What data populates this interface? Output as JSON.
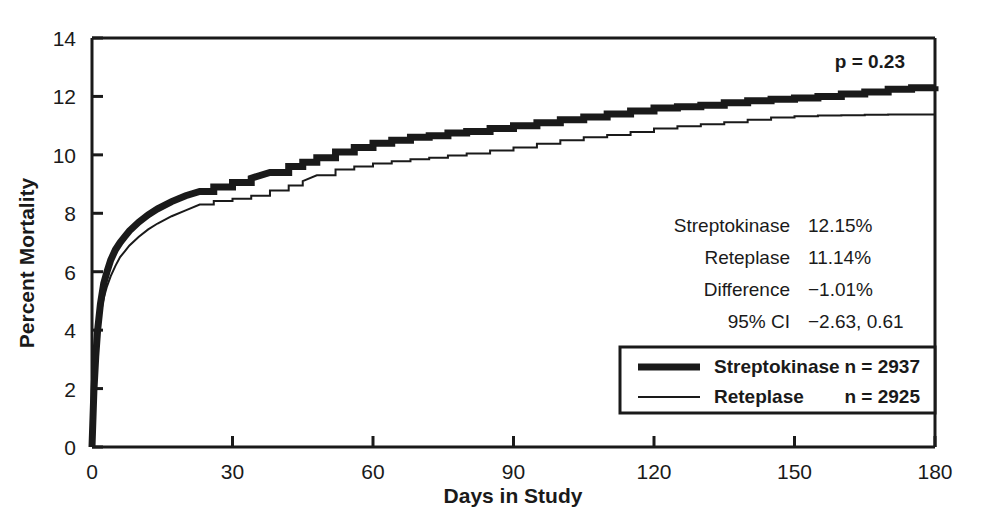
{
  "chart_data": {
    "type": "line",
    "title": "",
    "xlabel": "Days in Study",
    "ylabel": "Percent Mortality",
    "xlim": [
      0,
      180
    ],
    "ylim": [
      0,
      14
    ],
    "xticks": [
      0,
      30,
      60,
      90,
      120,
      150,
      180
    ],
    "yticks": [
      0,
      2,
      4,
      6,
      8,
      10,
      12,
      14
    ],
    "grid": false,
    "legend_position": "inside-lower-right",
    "annotations": {
      "p_value": "p = 0.23"
    },
    "series": [
      {
        "name": "Streptokinase",
        "n_label": "n = 2937",
        "n": 2937,
        "style": "thick",
        "final_value": 12.15,
        "x": [
          0,
          0.4,
          0.8,
          1.2,
          1.8,
          2.5,
          3.2,
          4,
          5,
          6,
          7,
          8,
          10,
          12,
          14,
          17,
          20,
          23,
          26,
          30,
          34,
          38,
          42,
          45,
          48,
          52,
          56,
          60,
          64,
          68,
          72,
          76,
          80,
          85,
          90,
          95,
          100,
          105,
          110,
          115,
          120,
          125,
          130,
          135,
          140,
          145,
          150,
          155,
          160,
          165,
          170,
          175,
          180
        ],
        "y": [
          0,
          1.9,
          3.1,
          4.0,
          4.9,
          5.6,
          6.0,
          6.4,
          6.75,
          7.0,
          7.2,
          7.4,
          7.7,
          7.95,
          8.15,
          8.4,
          8.6,
          8.75,
          8.9,
          9.05,
          9.2,
          9.4,
          9.6,
          9.75,
          9.9,
          10.1,
          10.25,
          10.4,
          10.5,
          10.6,
          10.65,
          10.75,
          10.8,
          10.9,
          11.0,
          11.1,
          11.2,
          11.3,
          11.4,
          11.5,
          11.6,
          11.65,
          11.7,
          11.78,
          11.85,
          11.9,
          11.95,
          12.0,
          12.08,
          12.15,
          12.25,
          12.3,
          12.35
        ]
      },
      {
        "name": "Reteplase",
        "n_label": "n = 2925",
        "n": 2925,
        "style": "thin",
        "final_value": 11.14,
        "x": [
          0,
          0.4,
          0.8,
          1.2,
          1.8,
          2.5,
          3.2,
          4,
          5,
          6,
          7,
          8,
          10,
          12,
          14,
          17,
          20,
          23,
          26,
          30,
          34,
          38,
          42,
          45,
          48,
          52,
          56,
          60,
          64,
          68,
          72,
          76,
          80,
          85,
          90,
          95,
          100,
          105,
          110,
          115,
          120,
          125,
          130,
          135,
          140,
          145,
          150,
          155,
          160,
          165,
          170,
          175,
          180
        ],
        "y": [
          0,
          1.75,
          2.9,
          3.7,
          4.5,
          5.1,
          5.5,
          5.85,
          6.2,
          6.5,
          6.7,
          6.9,
          7.2,
          7.45,
          7.65,
          7.9,
          8.1,
          8.3,
          8.42,
          8.5,
          8.6,
          8.78,
          8.95,
          9.1,
          9.3,
          9.5,
          9.6,
          9.7,
          9.78,
          9.85,
          9.9,
          9.98,
          10.05,
          10.15,
          10.25,
          10.38,
          10.5,
          10.6,
          10.68,
          10.78,
          10.9,
          10.98,
          11.05,
          11.12,
          11.2,
          11.28,
          11.32,
          11.35,
          11.36,
          11.37,
          11.38,
          11.38,
          11.35
        ]
      }
    ]
  },
  "stats_panel": {
    "rows": [
      {
        "label": "Streptokinase",
        "value": "12.15%"
      },
      {
        "label": "Reteplase",
        "value": "11.14%"
      },
      {
        "label": "Difference",
        "value": "−1.01%"
      },
      {
        "label": "95% CI",
        "value": "−2.63, 0.61"
      }
    ]
  },
  "legend": {
    "entries": [
      {
        "label": "Streptokinase",
        "count": "n = 2937"
      },
      {
        "label": "Reteplase",
        "count": "n = 2925"
      }
    ]
  },
  "axes": {
    "x_title": "Days in Study",
    "y_title": "Percent Mortality",
    "x_tick_labels": [
      "0",
      "30",
      "60",
      "90",
      "120",
      "150",
      "180"
    ],
    "y_tick_labels": [
      "0",
      "2",
      "4",
      "6",
      "8",
      "10",
      "12",
      "14"
    ]
  },
  "annotation": {
    "p_value": "p = 0.23"
  },
  "colors": {
    "ink": "#1a1a1a",
    "background": "#ffffff"
  }
}
